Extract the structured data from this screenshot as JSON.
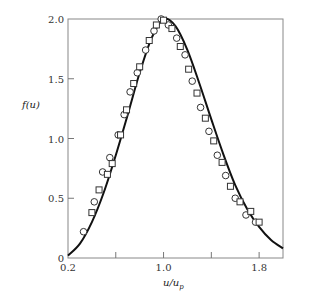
{
  "chart_data": {
    "type": "line",
    "title": "",
    "xlabel": "u/u_p",
    "ylabel": "f(u)",
    "xlim": [
      0.2,
      2.0
    ],
    "ylim": [
      0,
      2.0
    ],
    "grid": false,
    "legend": null,
    "x_ticks": [
      0.2,
      0.6,
      1.0,
      1.4,
      1.8
    ],
    "x_tick_labels": [
      "0.2",
      "",
      "1.0",
      "",
      "1.8"
    ],
    "y_ticks": [
      0,
      0.5,
      1.0,
      1.5,
      2.0
    ],
    "y_tick_labels": [
      "0",
      "0.5",
      "1.0",
      "1.5",
      "2.0"
    ],
    "series": [
      {
        "name": "theory curve",
        "style": "solid line",
        "x": [
          0.2,
          0.3,
          0.4,
          0.5,
          0.6,
          0.7,
          0.8,
          0.9,
          1.0,
          1.1,
          1.2,
          1.3,
          1.4,
          1.5,
          1.6,
          1.7,
          1.8,
          1.9,
          2.0
        ],
        "y": [
          0.02,
          0.12,
          0.3,
          0.55,
          0.86,
          1.2,
          1.55,
          1.84,
          2.0,
          1.94,
          1.74,
          1.46,
          1.16,
          0.87,
          0.61,
          0.41,
          0.26,
          0.15,
          0.08
        ]
      },
      {
        "name": "circles",
        "style": "open circle markers",
        "x": [
          0.33,
          0.42,
          0.49,
          0.55,
          0.62,
          0.67,
          0.72,
          0.78,
          0.85,
          0.92,
          0.98,
          1.04,
          1.11,
          1.18,
          1.24,
          1.31,
          1.38,
          1.45,
          1.52,
          1.6,
          1.69,
          1.77
        ],
        "y": [
          0.22,
          0.47,
          0.72,
          0.84,
          1.03,
          1.2,
          1.39,
          1.55,
          1.74,
          1.9,
          2.0,
          1.95,
          1.84,
          1.7,
          1.48,
          1.26,
          1.06,
          0.86,
          0.69,
          0.5,
          0.36,
          0.3
        ]
      },
      {
        "name": "squares",
        "style": "open square markers",
        "x": [
          0.4,
          0.46,
          0.53,
          0.57,
          0.64,
          0.69,
          0.75,
          0.8,
          0.88,
          0.94,
          1.0,
          1.07,
          1.14,
          1.21,
          1.28,
          1.35,
          1.42,
          1.49,
          1.56,
          1.64,
          1.73,
          1.8
        ],
        "y": [
          0.38,
          0.57,
          0.7,
          0.79,
          1.03,
          1.24,
          1.46,
          1.6,
          1.82,
          1.95,
          1.99,
          1.92,
          1.77,
          1.58,
          1.38,
          1.17,
          0.98,
          0.8,
          0.6,
          0.47,
          0.39,
          0.3
        ]
      }
    ]
  }
}
